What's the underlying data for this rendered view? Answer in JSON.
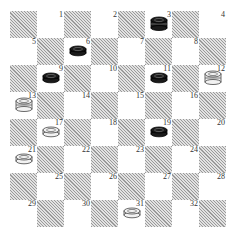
{
  "board": {
    "size": 8,
    "square_numbers": [
      "1",
      "2",
      "3",
      "4",
      "5",
      "6",
      "7",
      "8",
      "9",
      "10",
      "11",
      "12",
      "13",
      "14",
      "15",
      "16",
      "17",
      "18",
      "19",
      "20",
      "21",
      "22",
      "23",
      "24",
      "25",
      "26",
      "27",
      "28",
      "29",
      "30",
      "31",
      "32"
    ],
    "colors": {
      "hatch_dark": "#9a9a9a",
      "hatch_light": "#e2e2e2",
      "light_square": "#ffffff",
      "black_piece": "#1a1a1a",
      "white_piece": "#f2f2f2"
    }
  },
  "pieces": [
    {
      "square": 3,
      "color": "black",
      "type": "king"
    },
    {
      "square": 6,
      "color": "black",
      "type": "man"
    },
    {
      "square": 9,
      "color": "black",
      "type": "man"
    },
    {
      "square": 11,
      "color": "black",
      "type": "man"
    },
    {
      "square": 12,
      "color": "white",
      "type": "king"
    },
    {
      "square": 13,
      "color": "white",
      "type": "king"
    },
    {
      "square": 17,
      "color": "white",
      "type": "man"
    },
    {
      "square": 19,
      "color": "black",
      "type": "man"
    },
    {
      "square": 21,
      "color": "white",
      "type": "man"
    },
    {
      "square": 31,
      "color": "white",
      "type": "man"
    }
  ]
}
